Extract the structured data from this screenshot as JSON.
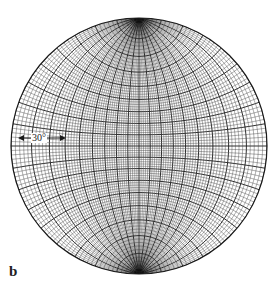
{
  "figure": {
    "panel_label": "b",
    "annotation": "30°",
    "type": "stereographic net",
    "center": [
      139,
      146
    ],
    "radius": 128,
    "colors": {
      "ink": "#1a1a1a",
      "background": "#ffffff"
    }
  }
}
